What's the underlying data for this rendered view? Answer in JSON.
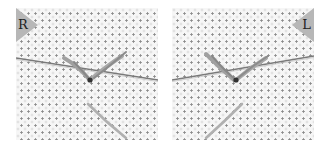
{
  "illustration": {
    "subject": "embroidery stitch on aida cloth with needle and thread",
    "panels": [
      {
        "id": "left",
        "label": "R",
        "side": "right-handed"
      },
      {
        "id": "right",
        "label": "L",
        "side": "left-handed"
      }
    ],
    "colors": {
      "fabric": "#f6f6f6",
      "fabric_holes": "#8a8a8a",
      "tag": "#b7b7b7",
      "thread": "#9a9a9a",
      "needle": "#7a7a7a"
    }
  }
}
